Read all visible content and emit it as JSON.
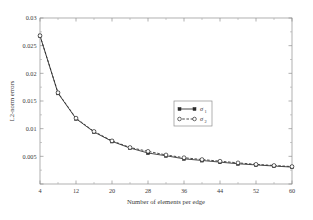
{
  "chart_data": {
    "type": "line",
    "title": "",
    "xlabel": "Number of elements per edge",
    "ylabel": "L2-norm errors",
    "xlim": [
      4,
      60
    ],
    "ylim": [
      0,
      0.03
    ],
    "xticks": [
      4,
      12,
      20,
      28,
      36,
      44,
      52,
      60
    ],
    "xtick_labels": [
      "4",
      "12",
      "20",
      "28",
      "36",
      "44",
      "52",
      "60"
    ],
    "yticks": [
      0,
      0.005,
      0.01,
      0.015,
      0.02,
      0.025,
      0.03
    ],
    "ytick_labels": [
      "",
      "0.005",
      "0.01",
      "0.015",
      "0.02",
      "0.025",
      "0.03"
    ],
    "grid": false,
    "legend_position": "center-right",
    "x": [
      4,
      8,
      12,
      16,
      20,
      24,
      28,
      32,
      36,
      40,
      44,
      48,
      52,
      56,
      60
    ],
    "series": [
      {
        "name": "sigma_1",
        "label": "σ",
        "subscript": "1",
        "linestyle": "solid",
        "marker": "filled-square",
        "color": "#2b2b2b",
        "values": [
          0.0268,
          0.0164,
          0.0118,
          0.0094,
          0.0077,
          0.0065,
          0.0056,
          0.0051,
          0.00455,
          0.00425,
          0.00395,
          0.00365,
          0.00345,
          0.00325,
          0.00305
        ]
      },
      {
        "name": "sigma_2",
        "label": "σ",
        "subscript": "2",
        "linestyle": "dashed",
        "marker": "open-circle",
        "color": "#2b2b2b",
        "values": [
          0.0268,
          0.0165,
          0.0119,
          0.0095,
          0.0078,
          0.0066,
          0.0059,
          0.00525,
          0.00475,
          0.00442,
          0.00412,
          0.00382,
          0.00355,
          0.00335,
          0.00315
        ]
      }
    ]
  },
  "legend": {
    "entries": [
      {
        "label": "σ",
        "subscript": "1"
      },
      {
        "label": "σ",
        "subscript": "2"
      }
    ]
  },
  "colors": {
    "axis": "#8f8f8f",
    "data": "#2b2b2b",
    "background": "#ffffff"
  }
}
